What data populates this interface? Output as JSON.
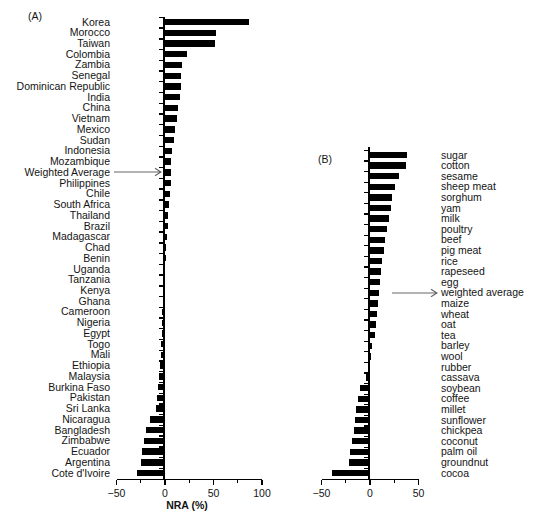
{
  "figure": {
    "panel_a_tag": "(A)",
    "panel_b_tag": "(B)"
  },
  "chart_data": [
    {
      "type": "bar",
      "panel": "A",
      "orientation": "horizontal",
      "bar_color": "#000000",
      "xlabel": "NRA (%)",
      "xlim": [
        -50,
        100
      ],
      "xticks": [
        -50,
        0,
        50,
        100
      ],
      "xticks_minor": [
        -25,
        25,
        75
      ],
      "arrow_target": "Weighted Average",
      "categories": [
        "Korea",
        "Morocco",
        "Taiwan",
        "Colombia",
        "Zambia",
        "Senegal",
        "Dominican Republic",
        "India",
        "China",
        "Vietnam",
        "Mexico",
        "Sudan",
        "Indonesia",
        "Mozambique",
        "Weighted Average",
        "Philippines",
        "Chile",
        "South Africa",
        "Thailand",
        "Brazil",
        "Madagascar",
        "Chad",
        "Benin",
        "Uganda",
        "Tanzania",
        "Kenya",
        "Ghana",
        "Cameroon",
        "Nigeria",
        "Egypt",
        "Togo",
        "Mali",
        "Ethiopia",
        "Malaysia",
        "Burkina Faso",
        "Pakistan",
        "Sri Lanka",
        "Nicaragua",
        "Bangladesh",
        "Zimbabwe",
        "Ecuador",
        "Argentina",
        "Cote d'Ivoire"
      ],
      "values": [
        87,
        53,
        52,
        23,
        18,
        17,
        16,
        15,
        13,
        12,
        10,
        9,
        7,
        6.5,
        6,
        6,
        5,
        4,
        3.5,
        3,
        2.5,
        1.5,
        -0.5,
        -1,
        -1.5,
        -2,
        -2.5,
        -3,
        -3,
        -3.5,
        -4,
        -4.5,
        -5.5,
        -6.5,
        -7,
        -8.5,
        -9,
        -15,
        -20,
        -21.5,
        -23.5,
        -24.5,
        -28.5
      ]
    },
    {
      "type": "bar",
      "panel": "B",
      "orientation": "horizontal",
      "bar_color": "#000000",
      "xlabel": "",
      "xlim": [
        -50,
        50
      ],
      "xticks": [
        -50,
        0,
        50
      ],
      "xticks_minor": [
        -25,
        25
      ],
      "arrow_target": "weighted average",
      "categories": [
        "sugar",
        "cotton",
        "sesame",
        "sheep meat",
        "sorghum",
        "yam",
        "milk",
        "poultry",
        "beef",
        "pig meat",
        "rice",
        "rapeseed",
        "egg",
        "weighted average",
        "maize",
        "wheat",
        "oat",
        "tea",
        "barley",
        "wool",
        "rubber",
        "cassava",
        "soybean",
        "coffee",
        "millet",
        "sunflower",
        "chickpea",
        "coconut",
        "palm oil",
        "groundnut",
        "cocoa"
      ],
      "values": [
        38,
        37,
        30,
        25.5,
        23,
        21.5,
        19.5,
        18,
        15.5,
        14.5,
        12,
        11,
        10,
        9,
        8,
        7,
        6.5,
        5.5,
        2.5,
        -0.5,
        -2,
        -4,
        -10,
        -12.5,
        -14,
        -15,
        -16,
        -18.5,
        -21,
        -22,
        -39.5
      ]
    }
  ]
}
